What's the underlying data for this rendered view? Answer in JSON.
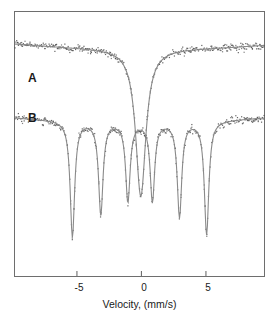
{
  "chart_data": {
    "type": "scatter",
    "title": "",
    "subtitle": "",
    "xlabel": "Velocity, (mm/s)",
    "ylabel": "",
    "xlim": [
      -9.8,
      9.5
    ],
    "ylim": [
      0,
      1
    ],
    "grid": false,
    "legend_position": "inline-left",
    "xticks": [
      -5,
      0,
      5
    ],
    "xticklabels": [
      "-5",
      "0",
      "5"
    ],
    "yticks": [],
    "yticklabels": [],
    "annotations": [
      {
        "text": "A",
        "x": -8.8,
        "y": 0.74,
        "name": "series-label-a"
      },
      {
        "text": "B",
        "x": -8.8,
        "y": 0.58,
        "name": "series-label-b"
      }
    ],
    "series": [
      {
        "name": "A",
        "label": "A",
        "marker": "dot",
        "color": "#4a4a4a",
        "fit_color": "#8a8a8a",
        "description": "Single broad central absorption line (quadrupole doublet collapsed), sloping baseline",
        "baseline": {
          "left_y": 0.88,
          "right_y": 0.875,
          "min_y": 0.845
        },
        "peaks": [
          {
            "center": -0.05,
            "depth": 0.56,
            "width": 0.95
          }
        ]
      },
      {
        "name": "B",
        "label": "B",
        "marker": "dot",
        "color": "#4a4a4a",
        "fit_color": "#8a8a8a",
        "description": "Magnetic hyperfine sextet with six absorption lines plus weak central component",
        "baseline": {
          "left_y": 0.6,
          "right_y": 0.6,
          "min_y": 0.57
        },
        "peaks": [
          {
            "center": -5.35,
            "depth": 0.44,
            "width": 0.42
          },
          {
            "center": -3.15,
            "depth": 0.35,
            "width": 0.42
          },
          {
            "center": -1.05,
            "depth": 0.3,
            "width": 0.42
          },
          {
            "center": 0.85,
            "depth": 0.3,
            "width": 0.42
          },
          {
            "center": 2.95,
            "depth": 0.36,
            "width": 0.42
          },
          {
            "center": 5.05,
            "depth": 0.43,
            "width": 0.42
          }
        ]
      }
    ]
  },
  "figure": {
    "frame_color": "#6e6e6e",
    "background": "#ffffff",
    "point_color": "#4a4a4a",
    "fit_color": "#8a8a8a",
    "axis_title": "Velocity, (mm/s)",
    "tick_labels": {
      "neg5": "-5",
      "zero": "0",
      "pos5": "5"
    },
    "series_labels": {
      "a": "A",
      "b": "B"
    }
  }
}
